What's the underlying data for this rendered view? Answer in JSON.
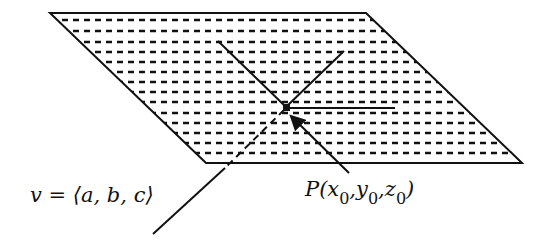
{
  "diagram": {
    "labels": {
      "vector": "v = ⟨a, b, c⟩",
      "point_prefix": "P(",
      "point_x": "x",
      "point_y": "y",
      "point_z": "z",
      "subscript": "0",
      "comma": ",",
      "close": ")"
    },
    "colors": {
      "line": "#111111",
      "background": "#ffffff"
    }
  }
}
